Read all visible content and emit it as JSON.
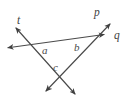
{
  "figure": {
    "type": "geometry-line-diagram",
    "width": 132,
    "height": 108,
    "background_color": "#ffffff",
    "stroke_color": "#4a4a4a",
    "stroke_width": 1.1,
    "line_labels": [
      {
        "id": "t",
        "text": "t",
        "x": 20,
        "y": 21
      },
      {
        "id": "p",
        "text": "p",
        "x": 97,
        "y": 13
      },
      {
        "id": "q",
        "text": "q",
        "x": 117,
        "y": 36
      }
    ],
    "angle_labels": [
      {
        "id": "a",
        "text": "a",
        "x": 46,
        "y": 50
      },
      {
        "id": "b",
        "text": "b",
        "x": 78,
        "y": 48
      },
      {
        "id": "c",
        "text": "c",
        "x": 57,
        "y": 68
      }
    ],
    "lines": [
      {
        "id": "line-t",
        "name": "t",
        "from": {
          "x": 14,
          "y": 26
        },
        "to": {
          "x": 77,
          "y": 96
        },
        "arrow_start": true,
        "arrow_end": true
      },
      {
        "id": "line-q",
        "name": "q",
        "from": {
          "x": 6,
          "y": 48
        },
        "to": {
          "x": 106,
          "y": 34
        },
        "arrow_start": true,
        "arrow_end": true
      },
      {
        "id": "line-p",
        "name": "p",
        "from": {
          "x": 112,
          "y": 22
        },
        "to": {
          "x": 44,
          "y": 93
        },
        "arrow_start": true,
        "arrow_end": true
      }
    ],
    "intersections": [
      {
        "id": "t-q",
        "x": 38,
        "y": 46,
        "angle_label": "a"
      },
      {
        "id": "p-q",
        "x": 91,
        "y": 40,
        "angle_label": "b"
      },
      {
        "id": "t-p",
        "x": 58,
        "y": 80,
        "angle_label": "c"
      }
    ]
  }
}
